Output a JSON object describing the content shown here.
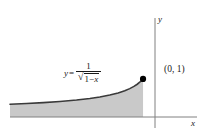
{
  "chart_data": {
    "type": "area",
    "title": "",
    "xlabel": "x",
    "ylabel": "y",
    "equation_text": "y = 1 / sqrt(1 - x)",
    "equation_parts": {
      "lhs": "y",
      "equals": "=",
      "numerator": "1",
      "radical_sign": "√",
      "radicand_one": "1",
      "radicand_minus": "−",
      "radicand_x": "x"
    },
    "annotations": [
      {
        "name": "endpoint-label",
        "text": "(0, 1)",
        "x": 0,
        "y": 1
      }
    ],
    "points": [
      {
        "x": 0,
        "y": 1,
        "marker": "filled-circle"
      }
    ],
    "xlim": [
      -8,
      1.2
    ],
    "ylim": [
      0,
      2.6
    ],
    "grid": false,
    "legend": null,
    "curve_x": [
      -8.0,
      -7.0,
      -6.0,
      -5.0,
      -4.0,
      -3.2,
      -2.6,
      -2.0,
      -1.5,
      -1.1,
      -0.8,
      -0.55,
      -0.35,
      -0.2,
      -0.1,
      -0.04,
      0.0
    ],
    "curve_y": [
      0.3333,
      0.3536,
      0.378,
      0.4082,
      0.4472,
      0.488,
      0.527,
      0.5774,
      0.6325,
      0.69,
      0.7454,
      0.8032,
      0.8607,
      0.9129,
      0.9535,
      0.9806,
      1.0
    ],
    "fill_region": "between curve and x-axis",
    "colors": {
      "curve": "#3a3a3a",
      "fill": "#c9c9c9",
      "axis": "#808080",
      "text": "#1a1a1a",
      "marker": "#000000",
      "background": "#ffffff"
    }
  },
  "axes": {
    "y_label": "y",
    "x_label": "x"
  }
}
